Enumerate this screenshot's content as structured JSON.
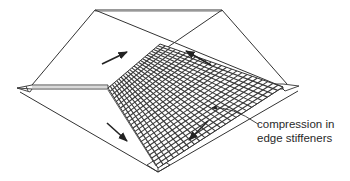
{
  "figure": {
    "annotation": {
      "line1": "compression in",
      "line2": "edge stiffeners"
    },
    "arrows": [
      {
        "name": "shear-arrow-upper-left",
        "direction": "up-right"
      },
      {
        "name": "shear-arrow-upper-right",
        "direction": "up-left"
      },
      {
        "name": "shear-arrow-lower-left",
        "direction": "down-right"
      },
      {
        "name": "shear-arrow-lower-right",
        "direction": "down-left"
      }
    ],
    "colors": {
      "line": "#333333",
      "grid": "#3a3a3a",
      "text": "#2a2a2a",
      "background": "#ffffff"
    }
  }
}
